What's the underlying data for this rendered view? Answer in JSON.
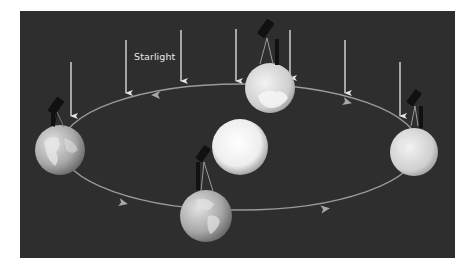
{
  "diagram": {
    "type": "stellar-parallax-aberration-diagram",
    "label": "Starlight",
    "colors": {
      "background": "#2e2e2e",
      "orbit": "#9a9a9a",
      "arrow": "#e6e6e6",
      "sun": "#f4f4f4",
      "earth": "#cfcfcf",
      "telescope": "#111111"
    },
    "elements": {
      "sun": {
        "cx": 240,
        "cy": 147,
        "r": 28
      },
      "orbit": {
        "cx": 240,
        "cy": 147,
        "rx": 179,
        "ry": 63
      },
      "earths": [
        {
          "name": "earth-left",
          "cx": 60,
          "cy": 150,
          "r": 25
        },
        {
          "name": "earth-top",
          "cx": 270,
          "cy": 88,
          "r": 25
        },
        {
          "name": "earth-right",
          "cx": 414,
          "cy": 152,
          "r": 24
        },
        {
          "name": "earth-bottom",
          "cx": 206,
          "cy": 216,
          "r": 26
        }
      ],
      "starlight_arrows": [
        {
          "x": 71,
          "y1": 62,
          "y2": 118
        },
        {
          "x": 126,
          "y1": 40,
          "y2": 95
        },
        {
          "x": 181,
          "y1": 30,
          "y2": 83
        },
        {
          "x": 236,
          "y1": 29,
          "y2": 83
        },
        {
          "x": 290,
          "y1": 30,
          "y2": 83
        },
        {
          "x": 345,
          "y1": 40,
          "y2": 95
        },
        {
          "x": 400,
          "y1": 62,
          "y2": 118
        }
      ],
      "orbit_direction_arrows": [
        {
          "x": 155,
          "y": 95,
          "dir": "left"
        },
        {
          "x": 347,
          "y": 101,
          "dir": "right"
        },
        {
          "x": 123,
          "y": 202,
          "dir": "right"
        },
        {
          "x": 325,
          "y": 209,
          "dir": "right"
        }
      ]
    }
  }
}
